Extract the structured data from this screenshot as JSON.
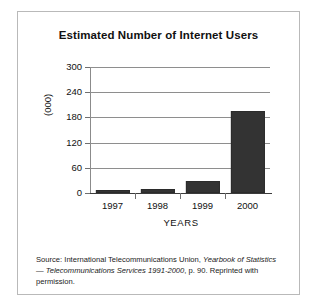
{
  "figure": {
    "title": "Estimated Number of Internet Users",
    "source_note": {
      "prefix": "Source: International Telecommunications Union, ",
      "italic_1": "Yearbook of Statistics",
      "mid": " — ",
      "italic_2": "Telecommunications Services 1991-2000",
      "suffix": ", p. 90. Reprinted with permission."
    }
  },
  "chart_data": {
    "type": "bar",
    "title": "Estimated Number of Internet Users",
    "categories": [
      "1997",
      "1998",
      "1999",
      "2000"
    ],
    "values": [
      7,
      9,
      28,
      195
    ],
    "xlabel": "YEARS",
    "ylabel": "(000)",
    "ylim": [
      0,
      300
    ],
    "yticks": [
      0,
      60,
      120,
      180,
      240,
      300
    ],
    "ytick_labels": [
      "0",
      "60",
      "120",
      "180",
      "240",
      "300"
    ],
    "grid": true,
    "legend": null,
    "bar_color": "#333333"
  }
}
